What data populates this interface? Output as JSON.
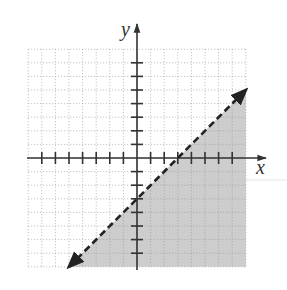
{
  "chart_data": {
    "type": "line",
    "title": "",
    "xlabel": "x",
    "ylabel": "y",
    "xlim": [
      -8,
      8
    ],
    "ylim": [
      -8,
      8
    ],
    "grid": true,
    "grid_style": "dotted",
    "x_ticks": [
      -7,
      -6,
      -5,
      -4,
      -3,
      -2,
      -1,
      1,
      2,
      3,
      4,
      5,
      6,
      7
    ],
    "y_ticks": [
      -7,
      -6,
      -5,
      -4,
      -3,
      -2,
      -1,
      1,
      2,
      3,
      4,
      5,
      6,
      7
    ],
    "tick_labels_shown": false,
    "series": [
      {
        "name": "boundary line y = x - 3",
        "style": "dashed",
        "arrows": "both",
        "points": [
          [
            -5,
            -8
          ],
          [
            0,
            -3
          ],
          [
            3,
            0
          ],
          [
            8,
            5
          ]
        ],
        "slope": 1,
        "y_intercept": -3,
        "x_intercept": 3
      }
    ],
    "shaded_region": {
      "description": "region below/right of the dashed line",
      "inequality": "y < x - 3",
      "color": "#c8c8c8"
    }
  },
  "labels": {
    "x_axis": "x",
    "y_axis": "y"
  },
  "colors": {
    "axis": "#333333",
    "grid": "#9a9a9a",
    "shade": "#c8c8c8",
    "line": "#222222"
  }
}
